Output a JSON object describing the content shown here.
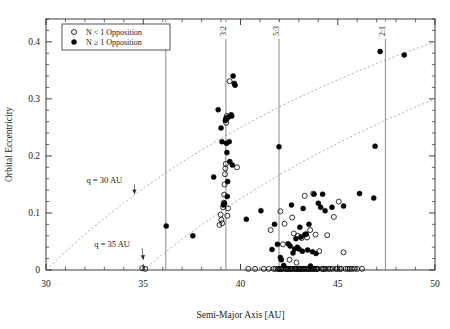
{
  "figure": {
    "background": "#ffffff",
    "axis_color": "#2b2b2b",
    "marker_fill": "#000000",
    "dashed_color": "#b0a9a9",
    "resonance_line_color": "#6d6d6d"
  },
  "axes": {
    "xlabel": "Semi-Major Axis [AU]",
    "ylabel": "Orbital Eccentricity",
    "xlim": [
      30,
      50
    ],
    "ylim": [
      0,
      0.44
    ],
    "xticks": [
      30,
      35,
      40,
      45,
      50
    ],
    "xticklabels": [
      "30",
      "35",
      "40",
      "45",
      "50"
    ],
    "yticks": [
      0,
      0.1,
      0.2,
      0.3,
      0.4
    ],
    "yticklabels": [
      "0",
      "0.1",
      "0.2",
      "0.3",
      "0.4"
    ],
    "xminor_step": 1,
    "yminor_step": 0.02,
    "grid": false
  },
  "legend": {
    "position": "top-left",
    "entries": [
      {
        "label": "N < 1 Opposition",
        "marker": "open-circle"
      },
      {
        "label": "N ≥ 1 Opposition",
        "marker": "filled-circle"
      }
    ]
  },
  "annotations": [
    {
      "name": "q30-label",
      "text": "q = 30 AU",
      "x": 33.0,
      "y": 0.152,
      "arrow_to_x": 34.55,
      "arrow_to_y": 0.133
    },
    {
      "name": "q35-label",
      "text": "q = 35 AU",
      "x": 33.4,
      "y": 0.04,
      "arrow_to_x": 35.0,
      "arrow_to_y": 0.018
    }
  ],
  "resonances": [
    {
      "label": "4:3",
      "a": 36.16
    },
    {
      "label": "3:2",
      "a": 39.25
    },
    {
      "label": "5:3",
      "a": 41.98
    },
    {
      "label": "2:1",
      "a": 47.45
    }
  ],
  "chart_data": {
    "type": "scatter",
    "title": "",
    "xlabel": "Semi-Major Axis [AU]",
    "ylabel": "Orbital Eccentricity",
    "xlim": [
      30,
      50
    ],
    "ylim": [
      0,
      0.44
    ],
    "grid": false,
    "legend_position": "top-left",
    "curves": [
      {
        "name": "q = 30 AU",
        "style": "dashed",
        "formula": "e = 1 - 30/a",
        "points": [
          [
            30,
            0.0
          ],
          [
            31,
            0.032
          ],
          [
            32,
            0.0625
          ],
          [
            33,
            0.0909
          ],
          [
            34,
            0.1176
          ],
          [
            35,
            0.1429
          ],
          [
            36,
            0.1667
          ],
          [
            37,
            0.1892
          ],
          [
            38,
            0.2105
          ],
          [
            39,
            0.2308
          ],
          [
            40,
            0.25
          ],
          [
            41,
            0.2683
          ],
          [
            42,
            0.2857
          ],
          [
            43,
            0.3023
          ],
          [
            44,
            0.3182
          ],
          [
            45,
            0.3333
          ],
          [
            46,
            0.3478
          ],
          [
            47,
            0.3617
          ],
          [
            48,
            0.375
          ],
          [
            49,
            0.3878
          ],
          [
            50,
            0.4
          ]
        ]
      },
      {
        "name": "q = 35 AU",
        "style": "dashed",
        "formula": "e = 1 - 35/a",
        "points": [
          [
            35,
            0.0
          ],
          [
            36,
            0.0278
          ],
          [
            37,
            0.0541
          ],
          [
            38,
            0.0789
          ],
          [
            39,
            0.1026
          ],
          [
            40,
            0.125
          ],
          [
            41,
            0.1463
          ],
          [
            42,
            0.1667
          ],
          [
            43,
            0.186
          ],
          [
            44,
            0.2045
          ],
          [
            45,
            0.2222
          ],
          [
            46,
            0.2391
          ],
          [
            47,
            0.2553
          ],
          [
            48,
            0.2708
          ],
          [
            49,
            0.2857
          ],
          [
            50,
            0.3
          ]
        ]
      }
    ],
    "series": [
      {
        "name": "N ≥ 1 Opposition",
        "marker": "filled-circle",
        "color": "#000000",
        "points": [
          [
            36.18,
            0.077
          ],
          [
            37.55,
            0.06
          ],
          [
            38.62,
            0.163
          ],
          [
            38.85,
            0.281
          ],
          [
            39.0,
            0.249
          ],
          [
            39.05,
            0.225
          ],
          [
            39.12,
            0.114
          ],
          [
            39.18,
            0.117
          ],
          [
            39.22,
            0.262
          ],
          [
            39.25,
            0.266
          ],
          [
            39.28,
            0.222
          ],
          [
            39.3,
            0.206
          ],
          [
            39.32,
            0.129
          ],
          [
            39.34,
            0.155
          ],
          [
            39.38,
            0.268
          ],
          [
            39.42,
            0.225
          ],
          [
            39.45,
            0.19
          ],
          [
            39.52,
            0.272
          ],
          [
            39.55,
            0.27
          ],
          [
            39.58,
            0.184
          ],
          [
            39.62,
            0.34
          ],
          [
            39.68,
            0.327
          ],
          [
            39.72,
            0.324
          ],
          [
            40.3,
            0.089
          ],
          [
            41.05,
            0.104
          ],
          [
            41.62,
            0.036
          ],
          [
            41.75,
            0.08
          ],
          [
            41.9,
            0.045
          ],
          [
            41.98,
            0.216
          ],
          [
            42.05,
            0.022
          ],
          [
            42.1,
            0.018
          ],
          [
            42.22,
            0.008
          ],
          [
            42.45,
            0.046
          ],
          [
            42.55,
            0.042
          ],
          [
            42.62,
            0.114
          ],
          [
            42.7,
            0.03
          ],
          [
            42.78,
            0.037
          ],
          [
            42.85,
            0.055
          ],
          [
            42.92,
            0.04
          ],
          [
            43.0,
            0.037
          ],
          [
            43.05,
            0.075
          ],
          [
            43.1,
            0.058
          ],
          [
            43.18,
            0.033
          ],
          [
            43.22,
            0.108
          ],
          [
            43.3,
            0.062
          ],
          [
            43.38,
            0.063
          ],
          [
            43.45,
            0.035
          ],
          [
            43.52,
            0.08
          ],
          [
            43.6,
            0.007
          ],
          [
            43.7,
            0.032
          ],
          [
            43.78,
            0.133
          ],
          [
            43.88,
            0.029
          ],
          [
            44.0,
            0.117
          ],
          [
            44.12,
            0.11
          ],
          [
            44.22,
            0.133
          ],
          [
            44.35,
            0.104
          ],
          [
            44.7,
            0.11
          ],
          [
            45.3,
            0.112
          ],
          [
            46.12,
            0.134
          ],
          [
            46.85,
            0.126
          ],
          [
            46.92,
            0.217
          ],
          [
            47.18,
            0.383
          ],
          [
            48.42,
            0.377
          ]
        ]
      },
      {
        "name": "N < 1 Opposition",
        "marker": "open-circle",
        "color": "#000000",
        "points": [
          [
            34.95,
            0.003
          ],
          [
            35.1,
            0.002
          ],
          [
            38.92,
            0.079
          ],
          [
            38.98,
            0.097
          ],
          [
            39.02,
            0.088
          ],
          [
            39.06,
            0.082
          ],
          [
            39.1,
            0.11
          ],
          [
            39.14,
            0.118
          ],
          [
            39.16,
            0.132
          ],
          [
            39.18,
            0.15
          ],
          [
            39.2,
            0.168
          ],
          [
            39.22,
            0.178
          ],
          [
            39.24,
            0.186
          ],
          [
            39.26,
            0.258
          ],
          [
            39.28,
            0.264
          ],
          [
            39.3,
            0.27
          ],
          [
            39.32,
            0.095
          ],
          [
            39.36,
            0.108
          ],
          [
            39.44,
            0.331
          ],
          [
            39.82,
            0.18
          ],
          [
            40.4,
            0.002
          ],
          [
            40.75,
            0.002
          ],
          [
            41.2,
            0.002
          ],
          [
            41.45,
            0.002
          ],
          [
            41.55,
            0.07
          ],
          [
            41.7,
            0.002
          ],
          [
            41.8,
            0.002
          ],
          [
            41.92,
            0.002
          ],
          [
            41.98,
            0.002
          ],
          [
            42.02,
            0.002
          ],
          [
            42.05,
            0.103
          ],
          [
            42.08,
            0.002
          ],
          [
            42.12,
            0.002
          ],
          [
            42.18,
            0.045
          ],
          [
            42.2,
            0.002
          ],
          [
            42.26,
            0.081
          ],
          [
            42.3,
            0.002
          ],
          [
            42.35,
            0.002
          ],
          [
            42.4,
            0.002
          ],
          [
            42.44,
            0.002
          ],
          [
            42.48,
            0.002
          ],
          [
            42.52,
            0.018
          ],
          [
            42.56,
            0.002
          ],
          [
            42.6,
            0.002
          ],
          [
            42.64,
            0.002
          ],
          [
            42.66,
            0.092
          ],
          [
            42.7,
            0.002
          ],
          [
            42.74,
            0.064
          ],
          [
            42.78,
            0.002
          ],
          [
            42.82,
            0.002
          ],
          [
            42.86,
            0.002
          ],
          [
            42.88,
            0.013
          ],
          [
            42.9,
            0.002
          ],
          [
            42.94,
            0.06
          ],
          [
            42.98,
            0.002
          ],
          [
            43.02,
            0.002
          ],
          [
            43.06,
            0.002
          ],
          [
            43.1,
            0.002
          ],
          [
            43.14,
            0.056
          ],
          [
            43.18,
            0.002
          ],
          [
            43.22,
            0.002
          ],
          [
            43.26,
            0.002
          ],
          [
            43.3,
            0.13
          ],
          [
            43.34,
            0.002
          ],
          [
            43.38,
            0.002
          ],
          [
            43.42,
            0.057
          ],
          [
            43.46,
            0.002
          ],
          [
            43.5,
            0.002
          ],
          [
            43.54,
            0.002
          ],
          [
            43.58,
            0.07
          ],
          [
            43.62,
            0.002
          ],
          [
            43.66,
            0.002
          ],
          [
            43.7,
            0.002
          ],
          [
            43.74,
            0.134
          ],
          [
            43.78,
            0.002
          ],
          [
            43.82,
            0.002
          ],
          [
            43.86,
            0.062
          ],
          [
            43.9,
            0.002
          ],
          [
            43.94,
            0.002
          ],
          [
            43.98,
            0.002
          ],
          [
            44.05,
            0.033
          ],
          [
            44.18,
            0.002
          ],
          [
            44.24,
            0.002
          ],
          [
            44.3,
            0.002
          ],
          [
            44.38,
            0.002
          ],
          [
            44.46,
            0.061
          ],
          [
            44.52,
            0.002
          ],
          [
            44.6,
            0.002
          ],
          [
            44.72,
            0.002
          ],
          [
            44.8,
            0.093
          ],
          [
            44.9,
            0.002
          ],
          [
            44.98,
            0.002
          ],
          [
            45.05,
            0.12
          ],
          [
            45.1,
            0.002
          ],
          [
            45.18,
            0.002
          ],
          [
            45.3,
            0.031
          ],
          [
            45.4,
            0.002
          ],
          [
            45.52,
            0.002
          ],
          [
            45.62,
            0.002
          ],
          [
            45.72,
            0.002
          ],
          [
            45.85,
            0.002
          ],
          [
            46.0,
            0.002
          ],
          [
            46.25,
            0.002
          ]
        ]
      }
    ]
  }
}
